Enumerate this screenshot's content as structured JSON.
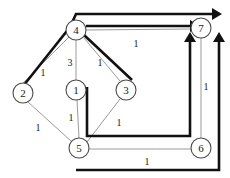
{
  "diagram": {
    "colors": {
      "background": "#ffffff",
      "node_stroke": "#4a4a4a",
      "node_fill": "#ffffff",
      "edge_stroke": "#9a9a9a",
      "highlight_stroke": "#111111",
      "text": "#1a1a1a"
    },
    "nodes": [
      {
        "id": "1",
        "label": "1",
        "cx": 76,
        "cy": 90,
        "r": 10
      },
      {
        "id": "2",
        "label": "2",
        "cx": 23,
        "cy": 93,
        "r": 10
      },
      {
        "id": "3",
        "label": "3",
        "cx": 126,
        "cy": 90,
        "r": 10
      },
      {
        "id": "4",
        "label": "4",
        "cx": 76,
        "cy": 30,
        "r": 10
      },
      {
        "id": "5",
        "label": "5",
        "cx": 79,
        "cy": 148,
        "r": 10
      },
      {
        "id": "6",
        "label": "6",
        "cx": 201,
        "cy": 148,
        "r": 10
      },
      {
        "id": "7",
        "label": "7",
        "cx": 201,
        "cy": 28,
        "r": 10
      }
    ],
    "edges": [
      {
        "from": "2",
        "to": "4",
        "weight": "1",
        "lx": 43,
        "ly": 72
      },
      {
        "from": "4",
        "to": "1",
        "weight": "3",
        "lx": 70,
        "ly": 62
      },
      {
        "from": "4",
        "to": "3",
        "weight": "1",
        "lx": 100,
        "ly": 62
      },
      {
        "from": "4",
        "to": "7",
        "weight": "1",
        "lx": 136,
        "ly": 43
      },
      {
        "from": "2",
        "to": "5",
        "weight": "1",
        "lx": 38,
        "ly": 127
      },
      {
        "from": "1",
        "to": "5",
        "weight": "1",
        "lx": 71,
        "ly": 117
      },
      {
        "from": "5",
        "to": "3",
        "weight": "1",
        "lx": 119,
        "ly": 122
      },
      {
        "from": "5",
        "to": "6",
        "weight": "1",
        "lx": 147,
        "ly": 161
      },
      {
        "from": "6",
        "to": "7",
        "weight": "1",
        "lx": 206,
        "ly": 86
      }
    ],
    "highlighted_paths": [
      {
        "name": "path-2-4-top-to-7",
        "points": "20,90 70,27 76,14 214,14",
        "arrow_at": "214,14",
        "arrow_dir": "right"
      },
      {
        "name": "path-4-to-7",
        "points": "86,26 192,26",
        "arrow_at": "192,26",
        "arrow_dir": "right"
      },
      {
        "name": "path-4-to-3-diagonal",
        "points": "84,35 132,80"
      },
      {
        "name": "path-1-5-6-to-7",
        "points": "87,87 87,136 190,136 190,36",
        "arrow_at": "190,36",
        "arrow_dir": "up"
      },
      {
        "name": "path-5-6-bottom-to-7",
        "points": "76,170 219,170 219,36",
        "arrow_at": "219,36",
        "arrow_dir": "up"
      }
    ]
  }
}
